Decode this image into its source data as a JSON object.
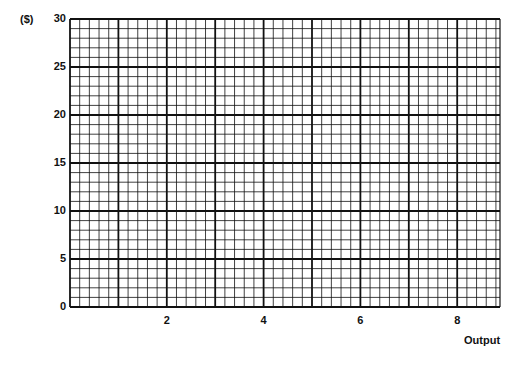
{
  "chart_data": {
    "type": "line",
    "title": "",
    "xlabel": "Output",
    "ylabel": "($)",
    "xlim": [
      0,
      8.9
    ],
    "ylim": [
      0,
      30
    ],
    "x_ticks": [
      "2",
      "4",
      "6",
      "8"
    ],
    "y_ticks": [
      "0",
      "5",
      "10",
      "15",
      "20",
      "25",
      "30"
    ],
    "grid": true,
    "grid_major_x_step": 1,
    "grid_minor_x_step": 0.2,
    "grid_major_y_step": 5,
    "grid_minor_y_step": 1,
    "series": []
  }
}
